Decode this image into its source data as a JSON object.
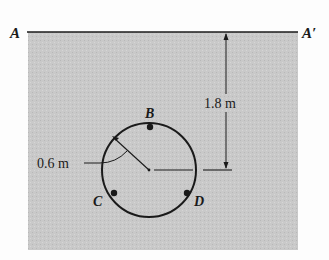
{
  "diagram": {
    "type": "cross-section",
    "colors": {
      "background": "#fdfdfd",
      "soil": "#c9c9c9",
      "line": "#1a1a1a"
    },
    "surface_line": {
      "left_label": "A",
      "right_label": "A′"
    },
    "depth_dimension": {
      "label": "1.8 m"
    },
    "pipe": {
      "radius_label": "0.6 m",
      "points": [
        {
          "id": "B",
          "label": "B"
        },
        {
          "id": "C",
          "label": "C"
        },
        {
          "id": "D",
          "label": "D"
        }
      ]
    }
  }
}
